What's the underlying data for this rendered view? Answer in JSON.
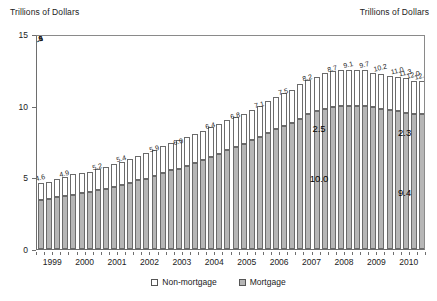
{
  "header": {
    "left_caption": "Trillions of Dollars",
    "right_caption": "Trillions of Dollars"
  },
  "legend": {
    "items": [
      {
        "label": "Non-mortgage",
        "swatch": "white-square-icon",
        "color": "#ffffff"
      },
      {
        "label": "Mortgage",
        "swatch": "gray-square-icon",
        "color": "#b6b6b6"
      }
    ]
  },
  "chart_data": {
    "type": "bar",
    "title": "",
    "subtitle": "",
    "xlabel": "",
    "ylabel": "Trillions of Dollars",
    "stacked": true,
    "grid": false,
    "legend_position": "bottom-center",
    "ylim": [
      0,
      15
    ],
    "yticks": [
      "0",
      "5",
      "10",
      "15"
    ],
    "ytick_values": [
      0,
      5,
      10,
      15
    ],
    "xticks": [
      "1999",
      "2000",
      "2001",
      "2002",
      "2003",
      "2004",
      "2005",
      "2006",
      "2007",
      "2008",
      "2009",
      "2010"
    ],
    "x_note": "quarterly bars grouped by year",
    "categories": [
      "1999Q1",
      "1999Q2",
      "1999Q3",
      "1999Q4",
      "2000Q1",
      "2000Q2",
      "2000Q3",
      "2000Q4",
      "2001Q1",
      "2001Q2",
      "2001Q3",
      "2001Q4",
      "2002Q1",
      "2002Q2",
      "2002Q3",
      "2002Q4",
      "2003Q1",
      "2003Q2",
      "2003Q3",
      "2003Q4",
      "2004Q1",
      "2004Q2",
      "2004Q3",
      "2004Q4",
      "2005Q1",
      "2005Q2",
      "2005Q3",
      "2005Q4",
      "2006Q1",
      "2006Q2",
      "2006Q3",
      "2006Q4",
      "2007Q1",
      "2007Q2",
      "2007Q3",
      "2007Q4",
      "2008Q1",
      "2008Q2",
      "2008Q3",
      "2008Q4",
      "2009Q1",
      "2009Q2",
      "2009Q3",
      "2009Q4",
      "2010Q1",
      "2010Q2",
      "2010Q3",
      "2010Q4"
    ],
    "series": [
      {
        "name": "Mortgage",
        "color": "#b6b6b6",
        "values": [
          3.4,
          3.5,
          3.6,
          3.7,
          3.8,
          3.9,
          4.0,
          4.1,
          4.2,
          4.3,
          4.5,
          4.6,
          4.8,
          4.9,
          5.1,
          5.3,
          5.5,
          5.6,
          5.8,
          6.0,
          6.2,
          6.4,
          6.6,
          6.9,
          7.1,
          7.3,
          7.6,
          7.8,
          8.1,
          8.4,
          8.6,
          8.8,
          9.1,
          9.4,
          9.6,
          9.8,
          9.9,
          10.0,
          10.0,
          10.0,
          10.0,
          9.9,
          9.8,
          9.7,
          9.6,
          9.5,
          9.4,
          9.4
        ]
      },
      {
        "name": "Non-mortgage",
        "color": "#ffffff",
        "values": [
          1.2,
          1.2,
          1.3,
          1.3,
          1.4,
          1.4,
          1.4,
          1.5,
          1.5,
          1.6,
          1.6,
          1.7,
          1.7,
          1.8,
          1.8,
          1.9,
          1.9,
          2.0,
          2.0,
          2.0,
          2.0,
          2.1,
          2.1,
          2.1,
          2.1,
          2.1,
          2.1,
          2.2,
          2.2,
          2.2,
          2.3,
          2.3,
          2.4,
          2.4,
          2.4,
          2.5,
          2.5,
          2.5,
          2.5,
          2.5,
          2.5,
          2.4,
          2.4,
          2.4,
          2.4,
          2.4,
          2.3,
          2.3
        ]
      }
    ],
    "totals": [
      4.6,
      4.7,
      4.8,
      4.9,
      5.1,
      5.2,
      5.3,
      5.4,
      5.6,
      5.8,
      5.9,
      6.0,
      6.2,
      6.4,
      6.6,
      6.8,
      7.0,
      7.1,
      7.3,
      7.5,
      7.9,
      8.2,
      8.5,
      8.7,
      8.9,
      9.1,
      9.4,
      9.7,
      9.9,
      10.2,
      10.6,
      11.0,
      11.3,
      11.6,
      11.8,
      12.0,
      12.2,
      12.4,
      12.5,
      12.5,
      12.5,
      12.4,
      12.3,
      12.2,
      12.1,
      11.9,
      11.8,
      11.7
    ],
    "value_labels": [
      {
        "index": 0,
        "text": "4.6"
      },
      {
        "index": 3,
        "text": "4.9"
      },
      {
        "index": 7,
        "text": "5.2"
      },
      {
        "index": 10,
        "text": "5.4"
      },
      {
        "index": 14,
        "text": "5.9"
      },
      {
        "index": 17,
        "text": "6.0"
      },
      {
        "index": 21,
        "text": "6.4"
      },
      {
        "index": 24,
        "text": "6.8"
      },
      {
        "index": 27,
        "text": "7.1"
      },
      {
        "index": 30,
        "text": "7.5"
      },
      {
        "index": 33,
        "text": "8.2"
      },
      {
        "index": 36,
        "text": "8.7"
      },
      {
        "index": 38,
        "text": "9.1"
      },
      {
        "index": 40,
        "text": "9.7"
      },
      {
        "index": 42,
        "text": "10.2"
      },
      {
        "index": 44,
        "text": "11.0"
      },
      {
        "index": 45,
        "text": "11.3"
      },
      {
        "index": 46,
        "text": "12.0"
      },
      {
        "index": 47,
        "text": "12.4"
      },
      {
        "index": 48,
        "text": "12.5"
      },
      {
        "index": 49,
        "text": "12.3"
      },
      {
        "index": 50,
        "text": "12.1"
      },
      {
        "index": 51,
        "text": "11.9"
      },
      {
        "index": 52,
        "text": "11.6"
      }
    ],
    "annotations": [
      {
        "text": "2.5",
        "series": "Non-mortgage",
        "period": "2008-2009"
      },
      {
        "text": "10.0",
        "series": "Mortgage",
        "period": "2008-2009"
      },
      {
        "text": "2.3",
        "series": "Non-mortgage",
        "period": "2010"
      },
      {
        "text": "9.4",
        "series": "Mortgage",
        "period": "2010"
      }
    ]
  }
}
